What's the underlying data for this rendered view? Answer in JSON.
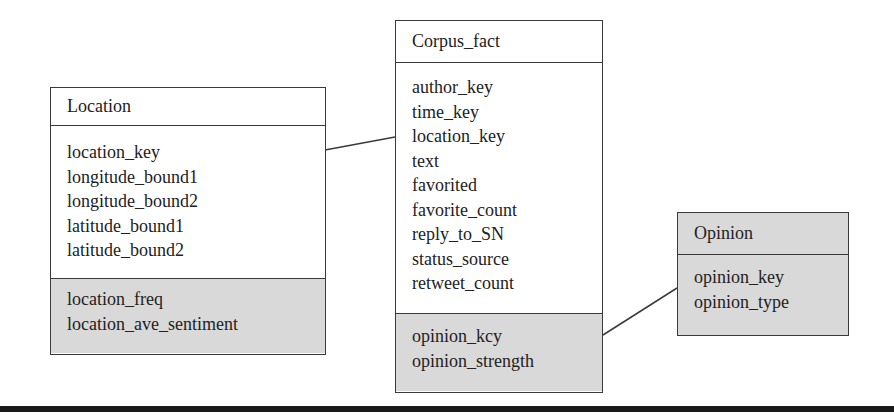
{
  "diagram": {
    "type": "star-schema",
    "entities": {
      "location": {
        "name": "Location",
        "fields": [
          "location_key",
          "longitude_bound1",
          "longitude_bound2",
          "latitude_bound1",
          "latitude_bound2"
        ],
        "derived_fields": [
          "location_freq",
          "location_ave_sentiment"
        ]
      },
      "corpus_fact": {
        "name": "Corpus_fact",
        "fields": [
          "author_key",
          "time_key",
          "location_key",
          "text",
          "favorited",
          "favorite_count",
          "reply_to_SN",
          "status_source",
          "retweet_count"
        ],
        "derived_fields": [
          "opinion_kcy",
          "opinion_strength"
        ]
      },
      "opinion": {
        "name": "Opinion",
        "fields": [
          "opinion_key",
          "opinion_type"
        ]
      }
    },
    "relationships": [
      {
        "from": "Location",
        "to": "Corpus_fact"
      },
      {
        "from": "Corpus_fact",
        "to": "Opinion"
      }
    ],
    "colors": {
      "border": "#3a3a3a",
      "shaded_section": "#d9d9d9",
      "background": "#ffffff",
      "bottom_rule": "#1a1a1a"
    }
  }
}
